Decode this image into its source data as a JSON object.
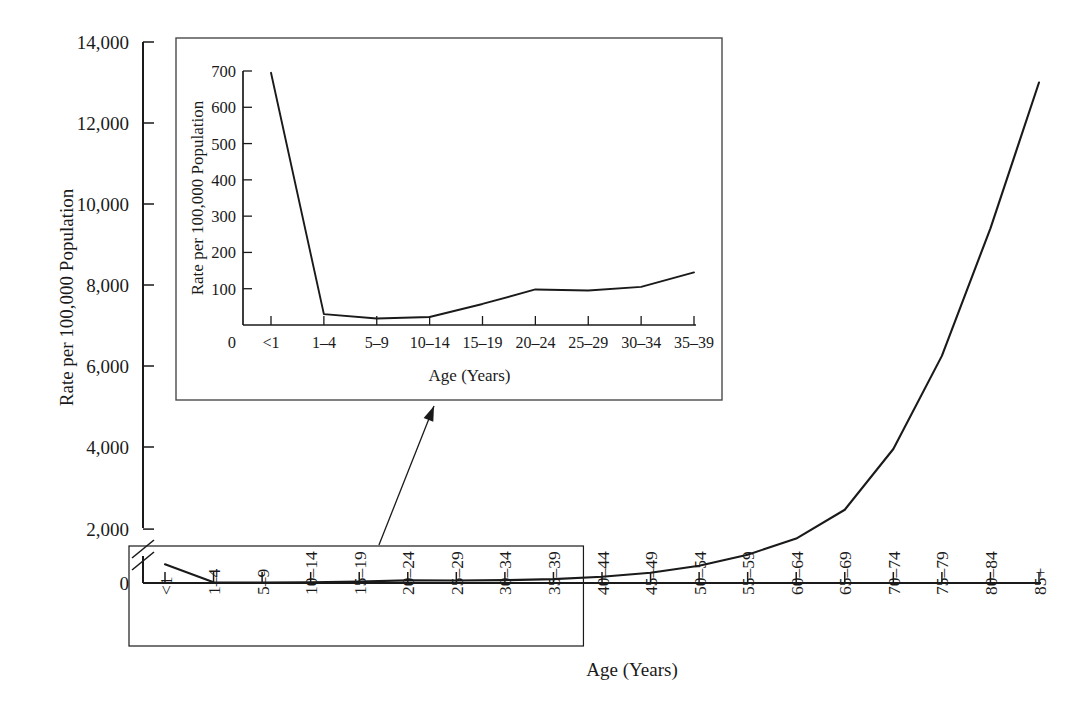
{
  "figure": {
    "name": "age-specific-rate-chart",
    "background": "#ffffff",
    "line_color": "#1a1a1a"
  },
  "chart_data": {
    "type": "line",
    "title": "",
    "xlabel": "Age (Years)",
    "ylabel": "Rate per 100,000 Population",
    "grid": false,
    "legend": "none",
    "axis_break": true,
    "axis_break_note": "Y axis broken between 0 and 2,000",
    "ylim": [
      0,
      14000
    ],
    "yticks": [
      0,
      2000,
      4000,
      6000,
      8000,
      10000,
      12000,
      14000
    ],
    "ytick_labels": [
      "0",
      "2,000",
      "4,000",
      "6,000",
      "8,000",
      "10,000",
      "12,000",
      "14,000"
    ],
    "categories": [
      "<1",
      "1–4",
      "5–9",
      "10–14",
      "15–19",
      "20–24",
      "25–29",
      "30–34",
      "35–39",
      "40–44",
      "45–49",
      "50–54",
      "55–59",
      "60–64",
      "65–69",
      "70–74",
      "75–79",
      "80–84",
      "85+"
    ],
    "values": [
      695,
      30,
      18,
      22,
      58,
      98,
      95,
      105,
      145,
      230,
      380,
      640,
      1050,
      1650,
      2450,
      3950,
      6250,
      9400,
      13000
    ],
    "inset": {
      "type": "line",
      "title": "",
      "xlabel": "Age (Years)",
      "ylabel": "Rate per 100,000 Population",
      "grid": false,
      "legend": "none",
      "ylim": [
        0,
        700
      ],
      "yticks": [
        0,
        100,
        200,
        300,
        400,
        500,
        600,
        700
      ],
      "ytick_labels": [
        "0",
        "100",
        "200",
        "300",
        "400",
        "500",
        "600",
        "700"
      ],
      "y_origin_label": "0",
      "categories": [
        "<1",
        "1–4",
        "5–9",
        "10–14",
        "15–19",
        "20–24",
        "25–29",
        "30–34",
        "35–39"
      ],
      "values": [
        695,
        30,
        18,
        22,
        58,
        98,
        95,
        105,
        145
      ]
    }
  },
  "labels": {
    "y_axis_title": "Rate per 100,000 Population",
    "x_axis_title": "Age (Years)",
    "inset_y_axis_title": "Rate per 100,000 Population",
    "inset_x_axis_title": "Age (Years)",
    "inset_origin": "0"
  }
}
